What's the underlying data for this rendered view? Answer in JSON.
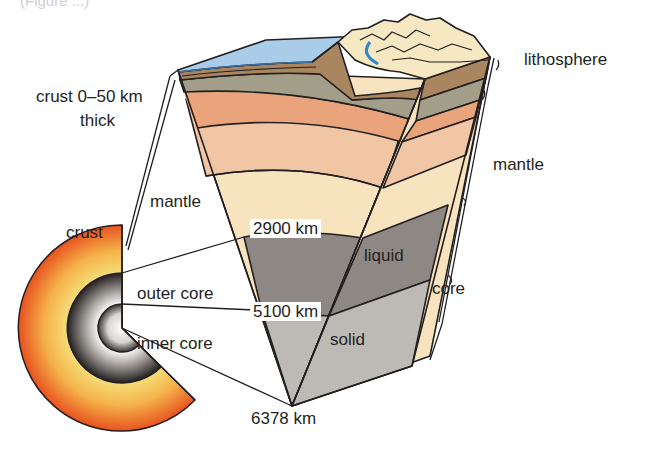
{
  "figure": {
    "caption_fragment": "(Figure ...)"
  },
  "labels": {
    "crust_thickness": "crust 0–50 km",
    "crust_thickness_line2": "thick",
    "lithosphere": "lithosphere",
    "mantle_right": "mantle",
    "mantle_left": "mantle",
    "crust": "crust",
    "depth_2900": "2900 km",
    "liquid": "liquid",
    "core_right": "core",
    "outer_core": "outer core",
    "depth_5100": "5100 km",
    "solid": "solid",
    "inner_core": "inner core",
    "depth_6378": "6378 km"
  },
  "colors": {
    "ocean": "#a9cde8",
    "ocean_dark": "#6aa8d6",
    "land": "#f6e8c3",
    "river": "#2f86c8",
    "crust_brown": "#a98660",
    "crust_gray": "#a39e8a",
    "upper_mantle": "#e9a47c",
    "mid_mantle": "#f0c6a4",
    "lower_mantle": "#f7e3bd",
    "outer_core": "#8d8883",
    "inner_core": "#bdb9b5",
    "sphere_outer": "#ea5a24",
    "sphere_inner": "#f6e07a",
    "outline": "#231f20"
  },
  "layers": [
    {
      "name": "crust",
      "depth": "0–50 km"
    },
    {
      "name": "mantle",
      "depth": "2900 km"
    },
    {
      "name": "outer core",
      "state": "liquid",
      "depth": "5100 km"
    },
    {
      "name": "inner core",
      "state": "solid",
      "depth": "6378 km"
    }
  ]
}
